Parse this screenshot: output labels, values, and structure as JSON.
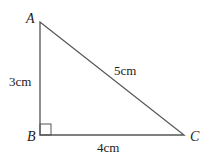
{
  "diagram": {
    "type": "right-triangle",
    "vertices": {
      "A": {
        "label": "A",
        "x": 40,
        "y": 22
      },
      "B": {
        "label": "B",
        "x": 40,
        "y": 135
      },
      "C": {
        "label": "C",
        "x": 184,
        "y": 135
      }
    },
    "sides": {
      "AB": {
        "label": "3cm"
      },
      "BC": {
        "label": "4cm"
      },
      "AC": {
        "label": "5cm"
      }
    },
    "right_angle_at": "B",
    "stroke_color": "#555555"
  }
}
